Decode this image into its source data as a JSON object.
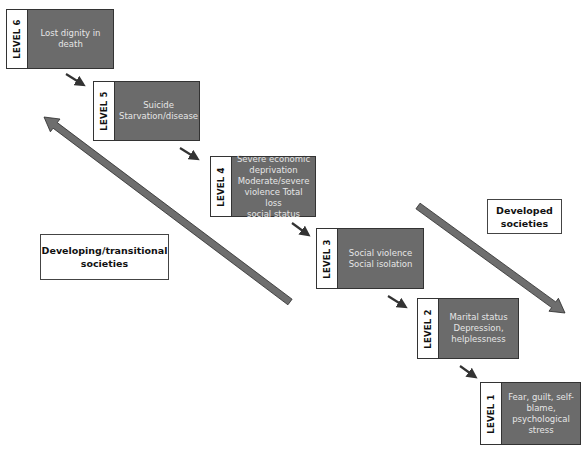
{
  "colors": {
    "box_fill": "#6b6b6b",
    "box_text": "#e6e6e6",
    "label_fill": "#ffffff",
    "arrow_fill": "#6e6e6e",
    "connector": "#333333"
  },
  "levels": [
    {
      "label": "LEVEL 6",
      "text": "Lost dignity in\ndeath",
      "box": [
        6,
        9,
        108,
        60
      ]
    },
    {
      "label": "LEVEL 5",
      "text": "Suicide\nStarvation/disease",
      "box": [
        93,
        81,
        107,
        60
      ]
    },
    {
      "label": "LEVEL 4",
      "text": "Severe economic\ndeprivation\nModerate/severe\nviolence Total loss\nsocial status",
      "box": [
        210,
        156,
        106,
        61
      ]
    },
    {
      "label": "LEVEL 3",
      "text": "Social violence\nSocial isolation",
      "box": [
        316,
        228,
        108,
        61
      ]
    },
    {
      "label": "LEVEL 2",
      "text": "Marital status\nDepression,\nhelplessness",
      "box": [
        417,
        298,
        102,
        61
      ]
    },
    {
      "label": "LEVEL 1",
      "text": "Fear, guilt, self-\nblame,\npsychological\nstress",
      "box": [
        480,
        382,
        101,
        63
      ]
    }
  ],
  "societies": {
    "developing": {
      "text": "Developing/transitional\nsocieties",
      "box": [
        40,
        234,
        129,
        46
      ]
    },
    "developed": {
      "text": "Developed\nsocieties",
      "box": [
        487,
        199,
        75,
        35
      ]
    }
  },
  "arrows": {
    "developing": {
      "direction": "up-left",
      "from": [
        290,
        302
      ],
      "to": [
        44,
        117
      ]
    },
    "developed": {
      "direction": "down-right",
      "from": [
        418,
        206
      ],
      "to": [
        565,
        313
      ]
    }
  },
  "connectors": [
    {
      "from": [
        66,
        74
      ],
      "to": [
        82,
        84
      ]
    },
    {
      "from": [
        180,
        148
      ],
      "to": [
        196,
        158
      ]
    },
    {
      "from": [
        292,
        223
      ],
      "to": [
        307,
        234
      ]
    },
    {
      "from": [
        388,
        296
      ],
      "to": [
        404,
        306
      ]
    },
    {
      "from": [
        460,
        366
      ],
      "to": [
        474,
        376
      ]
    }
  ]
}
